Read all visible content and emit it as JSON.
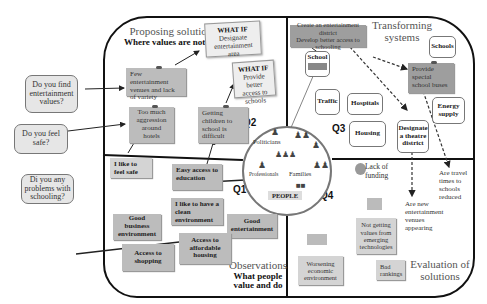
{
  "quadrant_titles": {
    "q1_top": {
      "main": "Proposing solutions",
      "sub": "Where values are not met"
    },
    "q3_top": {
      "main": "Transforming systems"
    },
    "q1_bottom": {
      "main": "Observations",
      "sub": "What people value and do"
    },
    "q4_bottom": {
      "main": "Evaluation of solutions"
    }
  },
  "quadrant_labels": {
    "q1": "Q1",
    "q2": "Q2",
    "q3": "Q3",
    "q4": "Q4"
  },
  "questions": [
    {
      "text": "Do you find entertainment values?"
    },
    {
      "text": "Do you feel safe?"
    },
    {
      "text": "Di you any problems with schooling?"
    }
  ],
  "proposing_notes": [
    {
      "text": "Few entertainment venues and lack of variety"
    },
    {
      "text": "Too much aggression around hotels"
    },
    {
      "text": "Getting children to school is difficult"
    }
  ],
  "whatif_cards": [
    {
      "heading": "WHAT IF",
      "text": "Designate entertainment area"
    },
    {
      "heading": "WHAT IF",
      "text": "Provide better access to schools"
    }
  ],
  "transform_banner": {
    "line1": "Create an entertainment district",
    "line2": "Develop better access to schooling"
  },
  "systems": {
    "school": "School",
    "schools": "Schools",
    "traffic": "Traffic",
    "hospitals": "Hospitals",
    "housing": "Housing",
    "energy": "Energy supply",
    "theatre": "Designate a theatre district"
  },
  "special_school_note": "Provide special school buses",
  "people": {
    "label": "PEOPLE",
    "politicians": "Politicians",
    "professionals": "Professionals",
    "families": "Families"
  },
  "observations": [
    {
      "text": "I like to feel safe"
    },
    {
      "text": "Easy access to education"
    },
    {
      "text": "I like to have a clean environment"
    },
    {
      "text": "Good business environment"
    },
    {
      "text": "Good entertainment"
    },
    {
      "text": "Access to affordable housing"
    },
    {
      "text": "Access to shopping"
    }
  ],
  "evaluation": {
    "lack_funding": "Lack of funding",
    "travel_times": "Are travel times to schools reduced",
    "new_venues": "Are new entertainment venues appearing",
    "not_getting_values": "Not getting values from emerging technologies",
    "worsening": "Worsening economic environment",
    "bad_rankings": "Bad rankings"
  },
  "colors": {
    "note_gray": "#bcbcbc",
    "note_dark": "#9e9e9e",
    "frame": "#111111",
    "question_bg": "#e6e6e6"
  }
}
